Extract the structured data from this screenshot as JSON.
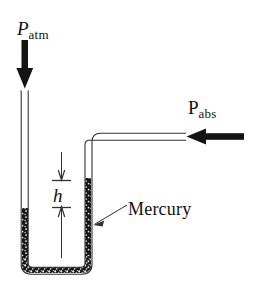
{
  "figure": {
    "background_color": "#ffffff",
    "ink_color": "#111111",
    "labels": {
      "p_atm": {
        "symbol": "P",
        "subscript": "atm",
        "full": "P_atm"
      },
      "p_abs": {
        "symbol": "P",
        "subscript": "abs",
        "full": "P_abs"
      },
      "height": {
        "symbol": "h"
      },
      "fluid": {
        "text": "Mercury"
      }
    },
    "annotations": {
      "atm_arrow_direction": "down",
      "abs_arrow_direction": "left",
      "h_dimension_direction": "vertical-double",
      "mercury_leader_direction": "down-left"
    },
    "elements": {
      "left_tube_label": "left-open-limb",
      "right_tube_label": "right-limb-to-pressure-source",
      "horizontal_tube_label": "horizontal-connector",
      "bend_label": "u-bend"
    }
  }
}
